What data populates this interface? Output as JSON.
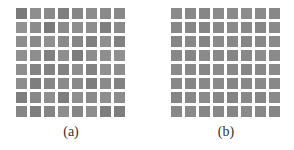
{
  "figure": {
    "panels": [
      {
        "label": "(a)",
        "rows": 8,
        "cols": 8,
        "description": "8x8 grid of learned filters with distinct edge/corner structure",
        "tiles": [
          [
            "#7a7a7a",
            "#8e8e8e",
            "#8a8a8a",
            "#7e7e7e",
            "#868686",
            "#8c8c8c",
            "#8a8a8a",
            "#888888"
          ],
          [
            "#929292",
            "#8c8c8c",
            "#7a7a7a",
            "#8a8a8a",
            "#8e8e8e",
            "#8e8e8e",
            "#7e7e7e",
            "#8a8a8a"
          ],
          [
            "#8e8e8e",
            "#8a8a8a",
            "#909090",
            "#8a8a8a",
            "#868686",
            "#808080",
            "#8e8e8e",
            "#808080"
          ],
          [
            "#909090",
            "#8e8e8e",
            "#808080",
            "#8e8e8e",
            "#7c7c7c",
            "#8e8e8e",
            "#8e8e8e",
            "#909090"
          ],
          [
            "#8e8e8e",
            "#848484",
            "#828282",
            "#828282",
            "#8e8e8e",
            "#828282",
            "#909090",
            "#8e8e8e"
          ],
          [
            "#8e8e8e",
            "#7e7e7e",
            "#868686",
            "#8a8a8a",
            "#8a8a8a",
            "#7e7e7e",
            "#8a8a8a",
            "#828282"
          ],
          [
            "#7e7e7e",
            "#888888",
            "#8e8e8e",
            "#7e7e7e",
            "#8e8e8e",
            "#8a8a8a",
            "#8e8e8e",
            "#8c8c8c"
          ],
          [
            "#868686",
            "#7e7e7e",
            "#848484",
            "#8e8e8e",
            "#868686",
            "#8e8e8e",
            "#7e7e7e",
            "#7e7e7e"
          ]
        ]
      },
      {
        "label": "(b)",
        "rows": 8,
        "cols": 8,
        "description": "8x8 grid of learned filters with noisy texture-like patterns",
        "tiles": [
          [
            "#8a8a8a",
            "#888888",
            "#868686",
            "#8a8a8a",
            "#8a8a8a",
            "#8c8c8c",
            "#8a8a8a",
            "#888888"
          ],
          [
            "#888888",
            "#868686",
            "#848484",
            "#888888",
            "#8a8a8a",
            "#888888",
            "#868686",
            "#8a8a8a"
          ],
          [
            "#868686",
            "#888888",
            "#848484",
            "#8a8a8a",
            "#888888",
            "#868686",
            "#888888",
            "#8a8a8a"
          ],
          [
            "#888888",
            "#868686",
            "#8a8a8a",
            "#888888",
            "#868686",
            "#888888",
            "#8c8c8c",
            "#8a8a8a"
          ],
          [
            "#8a8a8a",
            "#888888",
            "#868686",
            "#8a8a8a",
            "#888888",
            "#868686",
            "#888888",
            "#8a8a8a"
          ],
          [
            "#888888",
            "#868686",
            "#888888",
            "#8a8a8a",
            "#868686",
            "#888888",
            "#8a8a8a",
            "#888888"
          ],
          [
            "#868686",
            "#888888",
            "#8a8a8a",
            "#868686",
            "#848484",
            "#888888",
            "#868686",
            "#8a8a8a"
          ],
          [
            "#888888",
            "#8a8a8a",
            "#868686",
            "#888888",
            "#868686",
            "#8a8a8a",
            "#888888",
            "#868686"
          ]
        ]
      }
    ]
  }
}
